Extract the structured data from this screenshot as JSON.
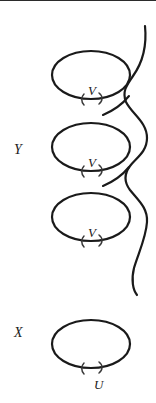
{
  "figure": {
    "width": 156,
    "height": 403,
    "background_color": "#ffffff",
    "stroke_color": "#1a1a1a",
    "labels": {
      "space_upper": "Y",
      "space_lower": "X",
      "loop_upper_1": "V",
      "loop_upper_2": "V",
      "loop_upper_3": "V",
      "loop_lower": "U"
    },
    "loops": [
      {
        "name": "upper-loop-1",
        "label": "V",
        "cx": 91,
        "cy": 75,
        "rx": 39,
        "ry": 24
      },
      {
        "name": "upper-loop-2",
        "label": "V",
        "cx": 91,
        "cy": 147,
        "rx": 39,
        "ry": 24
      },
      {
        "name": "upper-loop-3",
        "label": "V",
        "cx": 91,
        "cy": 217,
        "rx": 39,
        "ry": 24
      },
      {
        "name": "lower-loop",
        "label": "U",
        "cx": 91,
        "cy": 344,
        "rx": 39,
        "ry": 24
      }
    ],
    "helix": {
      "name": "helix-curve",
      "top_y": 26,
      "bottom_y": 295,
      "turns": 3
    }
  }
}
